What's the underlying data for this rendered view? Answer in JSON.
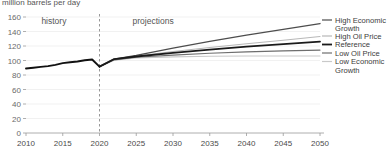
{
  "chart_data": {
    "type": "line",
    "title": "million barrels per day",
    "xlabel": "",
    "ylabel": "",
    "xlim": [
      2010,
      2050
    ],
    "ylim": [
      0,
      160
    ],
    "ytick_labels": [
      "160",
      "140",
      "120",
      "100",
      "80",
      "60",
      "40",
      "20",
      "0"
    ],
    "ytick_values": [
      160,
      140,
      120,
      100,
      80,
      60,
      40,
      20,
      0
    ],
    "xtick_labels": [
      "2010",
      "2015",
      "2020",
      "2025",
      "2030",
      "2035",
      "2040",
      "2045",
      "2050"
    ],
    "xtick_values": [
      2010,
      2015,
      2020,
      2025,
      2030,
      2035,
      2040,
      2045,
      2050
    ],
    "grid": true,
    "legend_position": "right-inline",
    "annotations": [
      {
        "name": "history-label",
        "text": "history",
        "x": 2015.5,
        "y": 150
      },
      {
        "name": "projections-label",
        "text": "projections",
        "x": 2024.5,
        "y": 150
      },
      {
        "name": "history-projection-divider",
        "text": "",
        "x": 2020,
        "y": 0
      }
    ],
    "history": {
      "name": "history",
      "color": "#111111",
      "x": [
        2010,
        2011,
        2012,
        2013,
        2014,
        2015,
        2016,
        2017,
        2018,
        2019,
        2020
      ],
      "values": [
        89.0,
        90.0,
        91.2,
        92.2,
        94.0,
        96.3,
        97.5,
        98.7,
        100.3,
        101.4,
        91.5
      ]
    },
    "series": [
      {
        "name": "High Economic Growth",
        "color": "#4d4d4d",
        "width": 1.3,
        "x": [
          2020,
          2022,
          2025,
          2030,
          2035,
          2040,
          2045,
          2050
        ],
        "values": [
          91.5,
          102.0,
          107.0,
          117.0,
          126.5,
          135.0,
          143.0,
          151.0
        ]
      },
      {
        "name": "High Oil Price",
        "color": "#b8b8b8",
        "width": 1.1,
        "x": [
          2020,
          2022,
          2025,
          2030,
          2035,
          2040,
          2045,
          2050
        ],
        "values": [
          91.5,
          101.5,
          106.0,
          112.5,
          118.0,
          123.0,
          128.0,
          133.0
        ]
      },
      {
        "name": "Reference",
        "color": "#1a1a1a",
        "width": 1.8,
        "x": [
          2020,
          2022,
          2025,
          2030,
          2035,
          2040,
          2045,
          2050
        ],
        "values": [
          91.5,
          102.0,
          105.5,
          110.5,
          115.0,
          119.0,
          122.5,
          126.0
        ]
      },
      {
        "name": "Low Oil Price",
        "color": "#6e6e6e",
        "width": 1.2,
        "x": [
          2020,
          2022,
          2025,
          2030,
          2035,
          2040,
          2045,
          2050
        ],
        "values": [
          91.5,
          101.0,
          104.5,
          107.5,
          110.0,
          112.0,
          113.3,
          114.3
        ]
      },
      {
        "name": "Low Economic Growth",
        "color": "#c9c9c9",
        "width": 1.1,
        "x": [
          2020,
          2022,
          2025,
          2030,
          2035,
          2040,
          2045,
          2050
        ],
        "values": [
          91.5,
          100.5,
          103.5,
          105.0,
          105.8,
          106.2,
          106.3,
          106.2
        ]
      }
    ],
    "legend": [
      {
        "label_line1": "High Economic",
        "label_line2": "Growth",
        "color": "#4d4d4d",
        "y": 20
      },
      {
        "label_line1": "High Oil Price",
        "label_line2": "",
        "color": "#b8b8b8",
        "y": 36
      },
      {
        "label_line1": "Reference",
        "label_line2": "",
        "color": "#1a1a1a",
        "y": 44.5
      },
      {
        "label_line1": "Low Oil Price",
        "label_line2": "",
        "color": "#6e6e6e",
        "y": 53
      },
      {
        "label_line1": "Low Economic",
        "label_line2": "Growth",
        "color": "#c9c9c9",
        "y": 61.5
      }
    ]
  }
}
